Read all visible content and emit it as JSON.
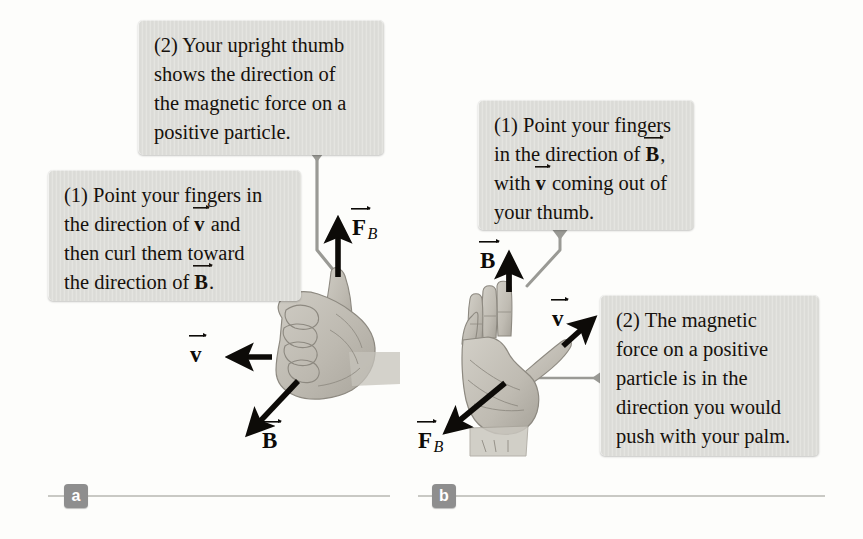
{
  "figure": {
    "background_color": "#fdfdfb",
    "callout_fill": "#dededa",
    "badge_color": "#8e8e8e",
    "arrow_color": "#0d0b08",
    "hand_color": "#b9b6ae",
    "leader_color": "#9a9a95"
  },
  "panels": [
    {
      "id": "a",
      "badge_label": "a",
      "hand": "right-hand-fist-thumb-up",
      "callouts": [
        {
          "id": "a-callout-2",
          "lines": [
            "(2) Your upright thumb",
            "shows the direction of",
            "the magnetic force on a",
            "positive particle."
          ]
        },
        {
          "id": "a-callout-1",
          "lines": [
            "(1) Point your fingers in",
            "the direction of v⃗ and",
            "then curl them toward",
            "the direction of B⃗."
          ],
          "line1": "(1) Point your fingers in",
          "line2_pre": "the direction of ",
          "line2_vec": "v",
          "line2_post": " and",
          "line3": "then curl them toward",
          "line4_pre": "the direction of ",
          "line4_vec": "B",
          "line4_post": "."
        }
      ],
      "vectors": [
        {
          "id": "a-vector-v",
          "symbol": "v",
          "subscript": "",
          "direction": "left"
        },
        {
          "id": "a-vector-B",
          "symbol": "B",
          "subscript": "",
          "direction": "down-left"
        },
        {
          "id": "a-vector-FB",
          "symbol": "F",
          "subscript": "B",
          "direction": "up"
        }
      ]
    },
    {
      "id": "b",
      "badge_label": "b",
      "hand": "right-hand-open-palm",
      "callouts": [
        {
          "id": "b-callout-1",
          "lines": [
            "(1) Point your fingers",
            "in the direction of B⃗,",
            "with v⃗ coming out of",
            "your thumb."
          ],
          "line1": "(1) Point your fingers",
          "line2_pre": "in the direction of ",
          "line2_vec": "B",
          "line2_post": ",",
          "line3_pre": "with ",
          "line3_vec": "v",
          "line3_post": " coming out of",
          "line4": "your thumb."
        },
        {
          "id": "b-callout-2",
          "lines": [
            "(2) The magnetic",
            "force on a positive",
            "particle is in the",
            "direction you would",
            "push with your palm."
          ]
        }
      ],
      "vectors": [
        {
          "id": "b-vector-B",
          "symbol": "B",
          "subscript": "",
          "direction": "up"
        },
        {
          "id": "b-vector-v",
          "symbol": "v",
          "subscript": "",
          "direction": "up-right"
        },
        {
          "id": "b-vector-FB",
          "symbol": "F",
          "subscript": "B",
          "direction": "down-left"
        }
      ]
    }
  ]
}
